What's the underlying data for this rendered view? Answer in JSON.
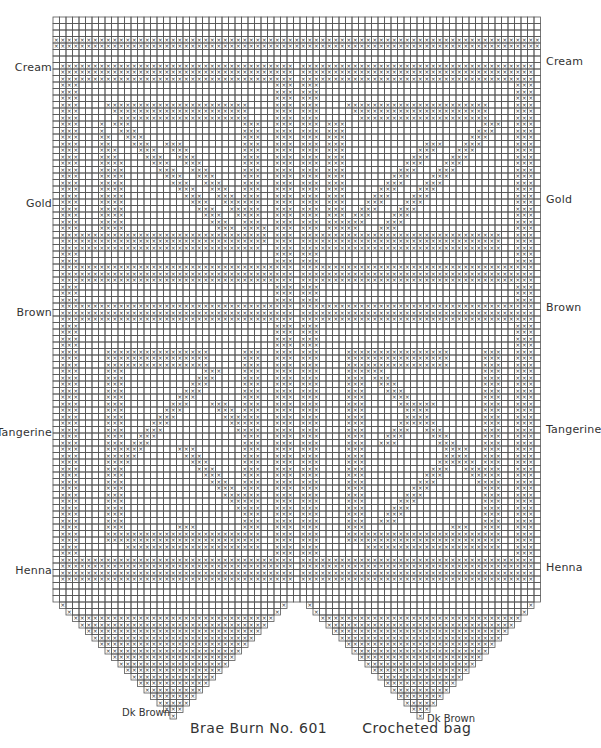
{
  "chart_data": {
    "type": "table",
    "title": "Brae Burn No. 601 Crocheted bag",
    "grid": {
      "columns": 75,
      "rows": 90,
      "cell_px": 6.5,
      "origin": [
        53,
        17
      ]
    },
    "panels": [
      {
        "name": "left",
        "col_start": 1,
        "col_end": 36
      },
      {
        "name": "right",
        "col_start": 38,
        "col_end": 73
      }
    ],
    "color_sections": [
      {
        "label": "Cream",
        "row": 8
      },
      {
        "label": "Gold",
        "row": 29
      },
      {
        "label": "Brown",
        "row": 46
      },
      {
        "label": "Tangerine",
        "row": 65
      },
      {
        "label": "Henna",
        "row": 86
      },
      {
        "label": "Dk Brown",
        "row": "triangle tip"
      }
    ],
    "triangle_rows": 18
  },
  "labels_left": [
    {
      "text": "Cream",
      "y": 68
    },
    {
      "text": "Gold",
      "y": 204
    },
    {
      "text": "Brown",
      "y": 313
    },
    {
      "text": "Tangerine",
      "y": 433
    },
    {
      "text": "Henna",
      "y": 571
    }
  ],
  "labels_right": [
    {
      "text": "Cream",
      "y": 62
    },
    {
      "text": "Gold",
      "y": 200
    },
    {
      "text": "Brown",
      "y": 308
    },
    {
      "text": "Tangerine",
      "y": 430
    },
    {
      "text": "Henna",
      "y": 568
    }
  ],
  "tip_labels": {
    "left": "Dk Brown",
    "right": "Dk Brown"
  },
  "caption": {
    "pattern_name": "Brae Burn No. 601",
    "item": "Crocheted bag"
  },
  "colors": {
    "line": "#555555",
    "mark": "#333333",
    "background": "#ffffff"
  }
}
